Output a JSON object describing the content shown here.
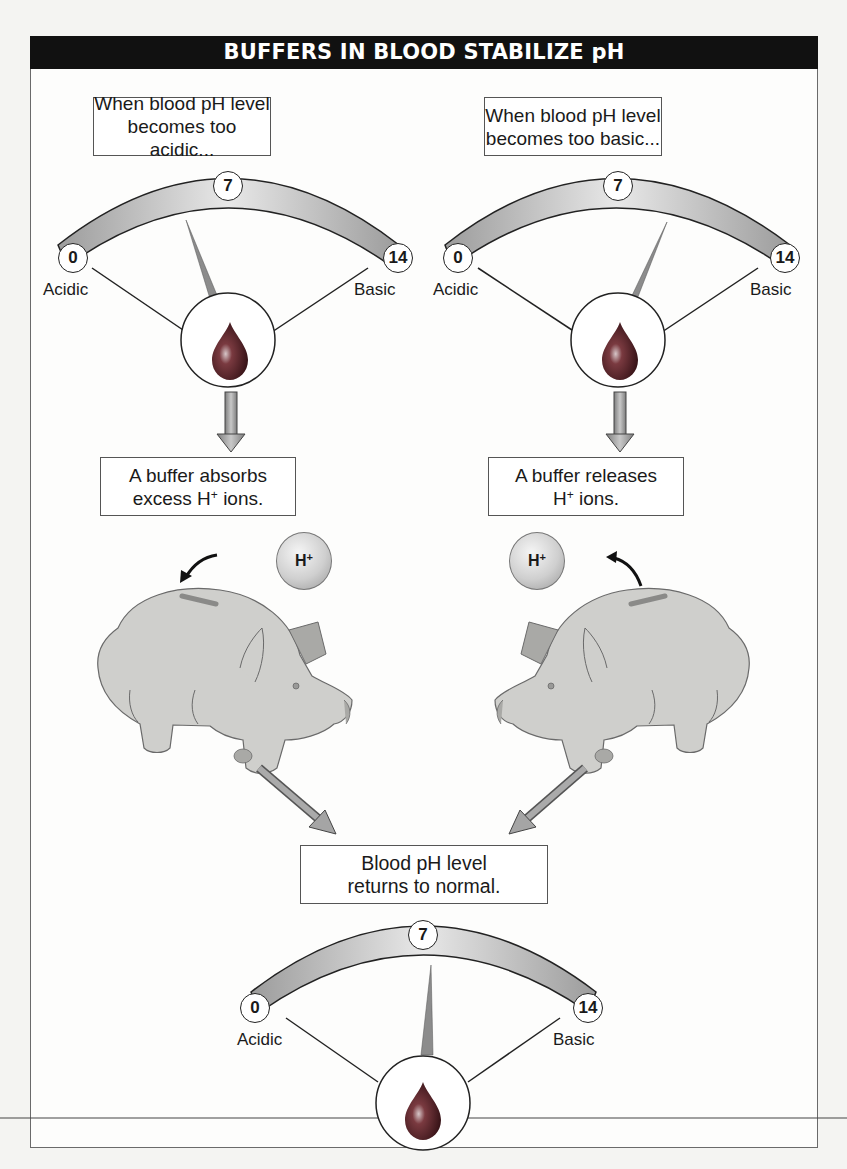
{
  "title": "BUFFERS IN BLOOD STABILIZE pH",
  "scale": {
    "min": "0",
    "mid": "7",
    "max": "14",
    "left_label": "Acidic",
    "right_label": "Basic"
  },
  "left_column": {
    "condition_line1": "When blood pH level",
    "condition_line2": "becomes too acidic...",
    "action_line1": "A buffer absorbs",
    "action_line2_pre": "excess H",
    "action_line2_sup": "+",
    "action_line2_post": " ions.",
    "ion_label": "H",
    "ion_sup": "+",
    "gauge_needle_direction": "toward acidic"
  },
  "right_column": {
    "condition_line1": "When blood pH level",
    "condition_line2": "becomes too basic...",
    "action_line1": "A buffer releases",
    "action_line2_pre": "H",
    "action_line2_sup": "+",
    "action_line2_post": " ions.",
    "ion_label": "H",
    "ion_sup": "+",
    "gauge_needle_direction": "toward basic"
  },
  "result": {
    "line1": "Blood pH level",
    "line2": "returns to normal.",
    "gauge_needle_direction": "neutral (7)"
  },
  "colors": {
    "title_bar": "#111111",
    "gauge_band": "#a9a9a9",
    "blood_drop": "#5a1f24",
    "arrow": "#9a9a9a",
    "pig": "#cfcfcc"
  }
}
